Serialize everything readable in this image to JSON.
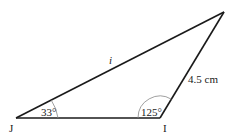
{
  "diagram": {
    "type": "triangle",
    "vertices": [
      {
        "name": "J",
        "label": "J",
        "x": 16,
        "y": 118
      },
      {
        "name": "I",
        "label": "I",
        "x": 160,
        "y": 118
      },
      {
        "name": "top",
        "label": "",
        "x": 224,
        "y": 12
      }
    ],
    "sides": [
      {
        "between": [
          "J",
          "top"
        ],
        "label": "i"
      },
      {
        "between": [
          "I",
          "top"
        ],
        "label": "4.5 cm"
      },
      {
        "between": [
          "J",
          "I"
        ],
        "label": ""
      }
    ],
    "angles": [
      {
        "vertex": "J",
        "label": "33°"
      },
      {
        "vertex": "I",
        "label": "125°"
      }
    ],
    "colors": {
      "stroke": "#1a1a1a",
      "arc": "#888888",
      "background": "#ffffff"
    }
  }
}
